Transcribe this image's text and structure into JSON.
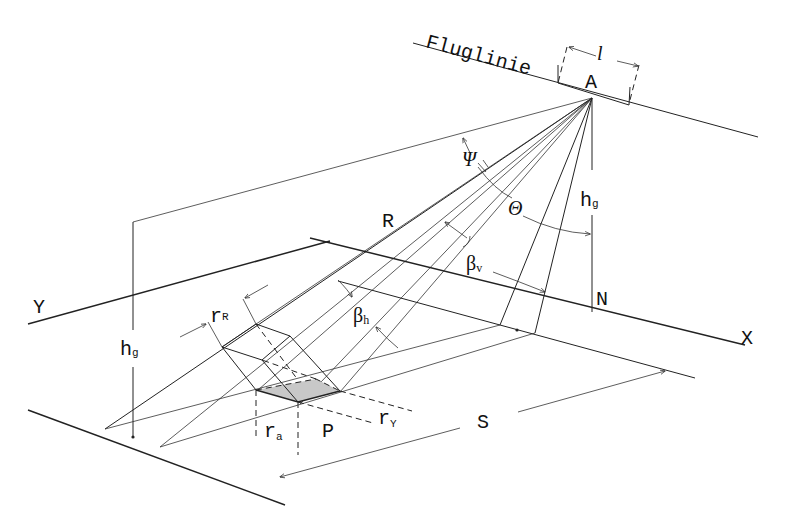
{
  "diagram": {
    "labels": {
      "flight_line": "Fluglinie",
      "antenna_length": "l",
      "antenna": "A",
      "depression_angle": "Ψ",
      "look_angle": "Θ",
      "slant_range": "R",
      "vertical_beamwidth_base": "β",
      "vertical_beamwidth_sub": "v",
      "horizontal_beamwidth_base": "β",
      "horizontal_beamwidth_sub": "h",
      "flight_height_right_base": "h",
      "flight_height_right_sub": "g",
      "flight_height_left_base": "h",
      "flight_height_left_sub": "g",
      "nadir": "N",
      "x_axis": "X",
      "y_axis": "Y",
      "range_resolution_base": "r",
      "range_resolution_sub": "R",
      "azimuth_resolution_base": "r",
      "azimuth_resolution_sub": "a",
      "ground_range_resolution_base": "r",
      "ground_range_resolution_sub": "Y",
      "point": "P",
      "ground_range": "S"
    },
    "colors": {
      "line": "#222222",
      "resolution_cell_fill": "#c8c8c8",
      "background": "#ffffff"
    }
  }
}
